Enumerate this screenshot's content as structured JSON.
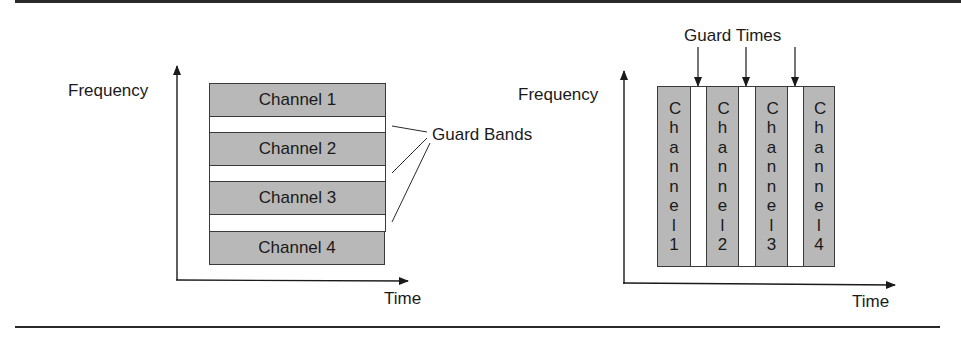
{
  "figure": {
    "fdm": {
      "y_axis_label": "Frequency",
      "x_axis_label": "Time",
      "channels": [
        "Channel 1",
        "Channel 2",
        "Channel 3",
        "Channel 4"
      ],
      "guard_label": "Guard Bands"
    },
    "tdm": {
      "y_axis_label": "Frequency",
      "x_axis_label": "Time",
      "channels": [
        "Channel1",
        "Channel2",
        "Channel3",
        "Channel4"
      ],
      "guard_label": "Guard Times"
    }
  },
  "colors": {
    "channel_fill": "#b8b8b8",
    "guard_fill": "#ffffff",
    "line": "#2a2a2a"
  }
}
